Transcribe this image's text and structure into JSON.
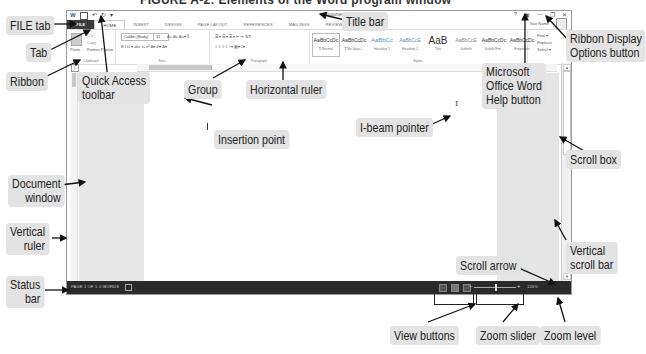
{
  "caption": "FIGURE A-2: Elements of the Word program window",
  "window": {
    "title": "Document1 - Word",
    "qat": {
      "save_icon": "💾",
      "undo_icon": "↶",
      "redo_icon": "↻",
      "customize_icon": "▾",
      "word_icon": "W"
    },
    "controls": {
      "help": "?",
      "ribbon_display": "▣",
      "minimize": "—",
      "restore": "❐",
      "close": "✕"
    },
    "user_name": "Your Name",
    "tabs": [
      "FILE",
      "HOME",
      "INSERT",
      "DESIGN",
      "PAGE LAYOUT",
      "REFERENCES",
      "MAILINGS",
      "REVIEW",
      "VIEW"
    ],
    "ribbon": {
      "clipboard": {
        "label": "Clipboard",
        "paste": "Paste",
        "cut": "Cut",
        "copy": "Copy",
        "format_painter": "Format Painter"
      },
      "font": {
        "label": "Font",
        "font_name": "Calibri (Body)",
        "font_size": "11",
        "row1": "A˄ A˅  Aa▾  ⁑",
        "row2": "B  I  U ▾ abc x₂ x²   A▾  ✐▾  A▾"
      },
      "paragraph": {
        "label": "Paragraph",
        "row1": "☰▾ ☰▾ ☰▾  ⇤ ⇥  ⇅  ¶",
        "row2": "≡ ≡ ≡ ≡  ↕▾  ▦▾ □▾"
      },
      "styles": {
        "label": "Styles",
        "items": [
          {
            "preview": "AaBbCcDc",
            "name": "¶ Normal"
          },
          {
            "preview": "AaBbCcDc",
            "name": "¶ No Spac..."
          },
          {
            "preview": "AaBbCc",
            "name": "Heading 1"
          },
          {
            "preview": "AaBbCcE",
            "name": "Heading 2"
          },
          {
            "preview": "AaB",
            "name": "Title"
          },
          {
            "preview": "AaBbCcE",
            "name": "Subtitle"
          },
          {
            "preview": "AaBbCcDc",
            "name": "Subtle Em..."
          },
          {
            "preview": "AaBbCcDc",
            "name": "Emphasis"
          }
        ]
      },
      "editing": {
        "find": "Find ▾",
        "replace": "Replace",
        "select": "Select ▾"
      }
    },
    "status_bar": {
      "page": "PAGE 1 OF 1",
      "words": "0 WORDS",
      "zoom_level": "120%",
      "zoom_minus": "–",
      "zoom_plus": "+"
    },
    "ibeam": "I"
  },
  "callouts": {
    "file_tab": "FILE tab",
    "tab": "Tab",
    "ribbon": "Ribbon",
    "quick_access": "Quick Access\ntoolbar",
    "quick_access_1": "Quick Access",
    "quick_access_2": "toolbar",
    "title_bar": "Title bar",
    "ribbon_display_1": "Ribbon Display",
    "ribbon_display_2": "Options button",
    "group": "Group",
    "horizontal_ruler": "Horizontal ruler",
    "help_1": "Microsoft",
    "help_2": "Office Word",
    "help_3": "Help button",
    "insertion_point": "Insertion point",
    "ibeam_pointer": "I-beam pointer",
    "scroll_box": "Scroll box",
    "document_window_1": "Document",
    "document_window_2": "window",
    "vertical_ruler_1": "Vertical",
    "vertical_ruler_2": "ruler",
    "vertical_scroll_1": "Vertical",
    "vertical_scroll_2": "scroll bar",
    "scroll_arrow": "Scroll arrow",
    "status_bar_1": "Status",
    "status_bar_2": "bar",
    "view_buttons": "View buttons",
    "zoom_slider": "Zoom slider",
    "zoom_level": "Zoom level"
  }
}
